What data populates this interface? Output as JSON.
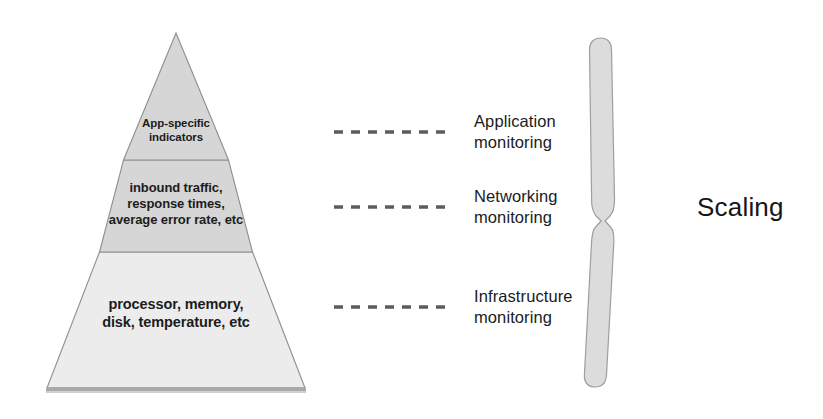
{
  "diagram": {
    "colors": {
      "tier_top_fill": "#d6d6d6",
      "tier_mid_fill": "#d6d6d6",
      "tier_base_fill": "#ececec",
      "outline": "#8a8a8a",
      "shadow_bar": "#a8a8a8",
      "brace_fill": "#dcdcdc",
      "brace_outline": "#9a9a9a",
      "text": "#1b1b1b",
      "dash": "#5c5c5c"
    },
    "pyramid": {
      "name": "monitoring-pyramid",
      "tiers": [
        {
          "id": "top",
          "level": 1,
          "label": "App-specific\nindicators",
          "fill": "#d6d6d6"
        },
        {
          "id": "middle",
          "level": 2,
          "label": "inbound traffic,\nresponse times,\naverage error rate, etc",
          "fill": "#d6d6d6"
        },
        {
          "id": "base",
          "level": 3,
          "label": "processor, memory,\ndisk, temperature, etc",
          "fill": "#ececec"
        }
      ]
    },
    "connectors": [
      {
        "id": "application",
        "dash_count": 7,
        "label": "Application\nmonitoring"
      },
      {
        "id": "networking",
        "dash_count": 7,
        "label": "Networking\nmonitoring"
      },
      {
        "id": "infrastructure",
        "dash_count": 7,
        "label": "Infrastructure\nmonitoring"
      }
    ],
    "brace": {
      "name": "curly-brace",
      "orientation": "right-facing"
    },
    "summary_label": "Scaling"
  }
}
